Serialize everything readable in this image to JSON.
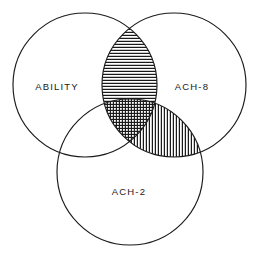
{
  "figure": {
    "type": "venn-diagram-3-set",
    "background_color": "#ffffff",
    "stroke_color": "#1a1a1a",
    "width": 262,
    "height": 262
  },
  "sets": [
    {
      "key": "ability",
      "label": "ABILITY",
      "position": "left",
      "cx": 85,
      "cy": 85,
      "r": 72,
      "label_x": 57,
      "label_y": 87
    },
    {
      "key": "ach8",
      "label": "ACH-8",
      "position": "right",
      "cx": 174,
      "cy": 85,
      "r": 72,
      "label_x": 192,
      "label_y": 87
    },
    {
      "key": "ach2",
      "label": "ACH-2",
      "position": "bottom",
      "cx": 130,
      "cy": 172,
      "r": 73,
      "label_x": 129,
      "label_y": 192
    }
  ],
  "regions": [
    {
      "key": "ability_only",
      "name": "ability-only-region",
      "sets": [
        "ability"
      ],
      "fill": "none",
      "hatch": "none"
    },
    {
      "key": "ach8_only",
      "name": "ach8-only-region",
      "sets": [
        "ach8"
      ],
      "fill": "none",
      "hatch": "none"
    },
    {
      "key": "ach2_only",
      "name": "ach2-only-region",
      "sets": [
        "ach2"
      ],
      "fill": "none",
      "hatch": "none"
    },
    {
      "key": "ability_ach8",
      "name": "ability-ach8-overlap-region",
      "sets": [
        "ability",
        "ach8"
      ],
      "fill": "hatched",
      "hatch": "horizontal",
      "hatch_spacing": 3,
      "hatch_color": "#1a1a1a"
    },
    {
      "key": "ach8_ach2",
      "name": "ach8-ach2-overlap-region",
      "sets": [
        "ach8",
        "ach2"
      ],
      "fill": "hatched",
      "hatch": "vertical",
      "hatch_spacing": 3,
      "hatch_color": "#1a1a1a"
    },
    {
      "key": "ability_ach2",
      "name": "ability-ach2-overlap-region",
      "sets": [
        "ability",
        "ach2"
      ],
      "fill": "none",
      "hatch": "none"
    },
    {
      "key": "triple",
      "name": "triple-overlap-region",
      "sets": [
        "ability",
        "ach8",
        "ach2"
      ],
      "fill": "hatched",
      "hatch": "cross",
      "hatch_spacing": 3,
      "hatch_color": "#1a1a1a"
    }
  ]
}
